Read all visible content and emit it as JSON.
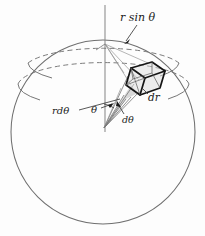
{
  "figure": {
    "background_color": "#fdfdfd",
    "ink_color": "#1b1b1b",
    "outline_color": "#6f6f6f",
    "dashed_color": "#757575",
    "cube_color": "#151515"
  },
  "labels": {
    "r_sin_theta": "r sin θ",
    "dr": "dr",
    "r_dtheta": "rdθ",
    "theta": "θ",
    "dtheta": "dθ"
  },
  "geometry": {
    "sphere": {
      "center_x": 103,
      "center_y": 132,
      "radius": 92
    },
    "apex": {
      "x": 104,
      "y": 128
    },
    "axis_point": {
      "x": 105,
      "y": 44
    },
    "volume_element": {
      "x": 124,
      "y": 62,
      "width": 41,
      "height": 33
    },
    "latitude_arcs": 2
  }
}
